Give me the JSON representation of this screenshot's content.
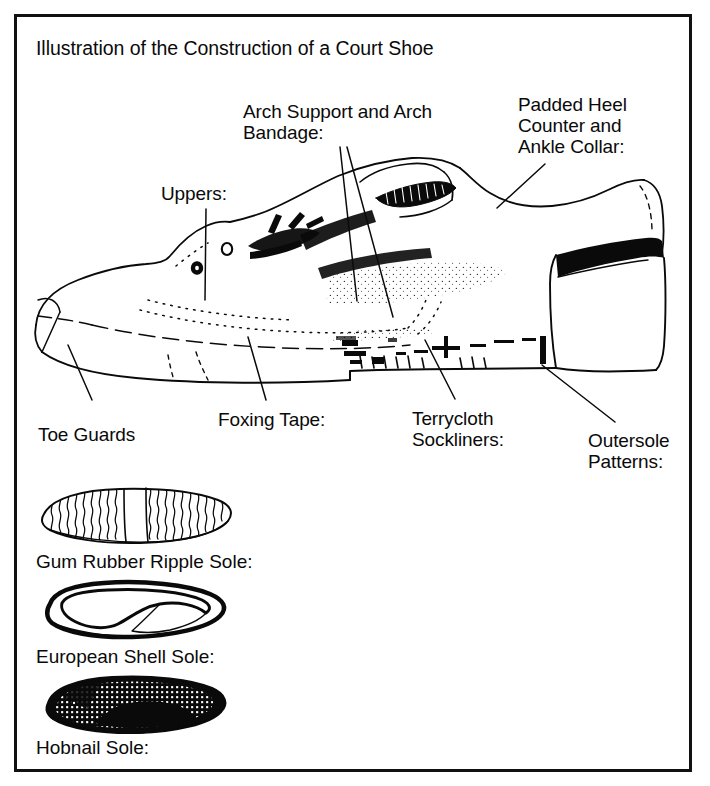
{
  "document": {
    "title": "Illustration of the Construction of a Court Shoe",
    "frame_color": "#111111",
    "ink_color": "#0a0a0a",
    "background": "#ffffff"
  },
  "callouts": {
    "uppers": "Uppers:",
    "arch_support_line1": "Arch Support and Arch",
    "arch_support_line2": "Bandage:",
    "padded_heel_line1": "Padded Heel",
    "padded_heel_line2": "Counter and",
    "padded_heel_line3": "Ankle Collar:",
    "toe_guards": "Toe Guards",
    "foxing_tape": "Foxing Tape:",
    "terrycloth_line1": "Terrycloth",
    "terrycloth_line2": "Sockliners:",
    "outersole_line1": "Outersole",
    "outersole_line2": "Patterns:"
  },
  "soles": [
    {
      "label": "Gum Rubber Ripple Sole:",
      "kind": "ripple-sole"
    },
    {
      "label": "European Shell Sole:",
      "kind": "shell-sole"
    },
    {
      "label": "Hobnail Sole:",
      "kind": "hobnail-sole"
    }
  ]
}
